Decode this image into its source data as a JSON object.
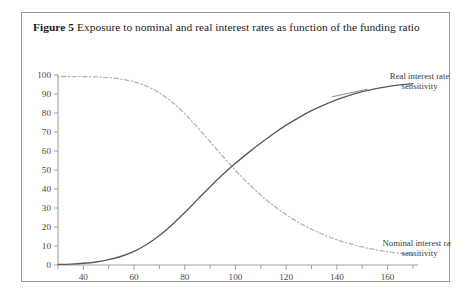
{
  "figure": {
    "label": "Figure 5",
    "caption": "Exposure to nominal and real interest rates as function of the funding ratio"
  },
  "chart_data": {
    "type": "line",
    "title": "Exposure to nominal and real interest rates as function of the funding ratio",
    "xlabel": "",
    "ylabel": "",
    "xlim": [
      30,
      172
    ],
    "ylim": [
      0,
      100
    ],
    "grid": false,
    "legend_position": "inline-right",
    "xticks": [
      40,
      60,
      80,
      100,
      120,
      140,
      160
    ],
    "xtick_labels": [
      "40",
      "60",
      "80",
      "100",
      "120",
      "140",
      "160"
    ],
    "xminor_ticks": [
      30,
      50,
      70,
      90,
      110,
      130,
      150,
      170
    ],
    "yticks": [
      0,
      10,
      20,
      30,
      40,
      50,
      60,
      70,
      80,
      90,
      100
    ],
    "ytick_labels": [
      "0",
      "10",
      "20",
      "30",
      "40",
      "50",
      "60",
      "70",
      "80",
      "90",
      "100"
    ],
    "x": [
      30,
      35,
      40,
      45,
      50,
      55,
      60,
      65,
      70,
      75,
      80,
      85,
      90,
      95,
      100,
      105,
      110,
      115,
      120,
      125,
      130,
      135,
      140,
      145,
      150,
      155,
      160,
      165,
      170
    ],
    "series": [
      {
        "name": "Real interest rate sensitivity",
        "style": "solid",
        "color": "#595959",
        "values": [
          0.3,
          0.5,
          0.9,
          1.6,
          2.8,
          4.6,
          7.2,
          10.8,
          15.5,
          21.2,
          27.6,
          34.4,
          41.2,
          47.6,
          53.5,
          59.0,
          64.2,
          69.1,
          73.6,
          77.6,
          81.2,
          84.3,
          87.0,
          89.3,
          91.2,
          92.7,
          93.9,
          94.8,
          95.4
        ]
      },
      {
        "name": "Nominal interest rate sensitivity",
        "style": "dash-dot",
        "color": "#b4b4b4",
        "values": [
          99.2,
          99.2,
          99.1,
          99.0,
          98.6,
          97.8,
          96.4,
          94.1,
          90.6,
          85.7,
          79.6,
          72.5,
          64.9,
          57.2,
          49.8,
          43.0,
          36.8,
          31.3,
          26.5,
          22.3,
          18.8,
          15.8,
          13.3,
          11.2,
          9.5,
          8.1,
          7.0,
          6.1,
          5.4
        ]
      }
    ],
    "annotations": [
      {
        "text_lines": [
          "Real interest rate",
          "sensitivity"
        ],
        "anchor_x": 160,
        "anchor_y": 95
      },
      {
        "text_lines": [
          "Nominal interest rate",
          "sensitivity"
        ],
        "anchor_x": 160,
        "anchor_y": 8
      }
    ]
  },
  "axis": {
    "line_color": "#a0a0a0"
  }
}
